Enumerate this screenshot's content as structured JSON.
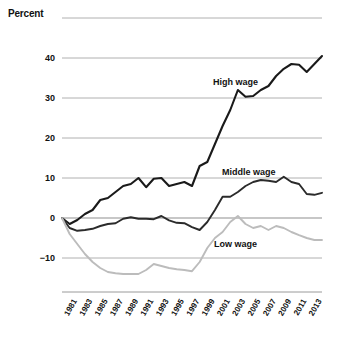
{
  "chart": {
    "title": "Percent",
    "ylabel": "Percent",
    "xlabel": ""
  },
  "series_labels": {
    "high": "High wage",
    "middle": "Middle wage",
    "low": "Low wage"
  },
  "yticks": [
    "40",
    "30",
    "20",
    "10",
    "0",
    "−10"
  ],
  "xticks": [
    "1981",
    "1983",
    "1985",
    "1987",
    "1989",
    "1991",
    "1993",
    "1995",
    "1997",
    "1999",
    "2001",
    "2003",
    "2005",
    "2007",
    "2009",
    "2011",
    "2013"
  ],
  "colors": {
    "high": "#1a1a1a",
    "middle": "#2b2b2b",
    "low": "#bcbcbc",
    "grid": "#b0b0b0",
    "text": "#111111"
  },
  "chart_data": {
    "type": "line",
    "title": "Percent",
    "xlabel": "",
    "ylabel": "Percent",
    "xlim": [
      1979,
      2013
    ],
    "ylim": [
      -15,
      50
    ],
    "yticks": [
      -10,
      0,
      10,
      20,
      30,
      40
    ],
    "xticks": [
      1981,
      1983,
      1985,
      1987,
      1989,
      1991,
      1993,
      1995,
      1997,
      1999,
      2001,
      2003,
      2005,
      2007,
      2009,
      2011,
      2013
    ],
    "grid": true,
    "legend": "inline-annotations",
    "x": [
      1979,
      1980,
      1981,
      1982,
      1983,
      1984,
      1985,
      1986,
      1987,
      1988,
      1989,
      1990,
      1991,
      1992,
      1993,
      1994,
      1995,
      1996,
      1997,
      1998,
      1999,
      2000,
      2001,
      2002,
      2003,
      2004,
      2005,
      2006,
      2007,
      2008,
      2009,
      2010,
      2011,
      2012,
      2013
    ],
    "series": [
      {
        "name": "High wage",
        "color": "#1a1a1a",
        "values": [
          0.0,
          -1.5,
          -0.5,
          1.0,
          2.0,
          4.5,
          5.0,
          6.5,
          8.0,
          8.5,
          10.0,
          7.7,
          9.8,
          10.0,
          8.0,
          8.5,
          9.0,
          8.0,
          13.0,
          14.0,
          18.5,
          23.0,
          27.0,
          32.0,
          30.3,
          30.5,
          32.0,
          33.0,
          35.5,
          37.3,
          38.5,
          38.3,
          36.5,
          38.5,
          40.5
        ]
      },
      {
        "name": "Middle wage",
        "color": "#2b2b2b",
        "values": [
          0.0,
          -2.5,
          -3.2,
          -3.0,
          -2.7,
          -2.0,
          -1.5,
          -1.3,
          -0.2,
          0.2,
          -0.2,
          -0.2,
          -0.3,
          0.5,
          -0.6,
          -1.2,
          -1.3,
          -2.3,
          -3.0,
          -1.0,
          2.0,
          5.3,
          5.3,
          6.5,
          8.0,
          9.0,
          9.5,
          9.3,
          9.0,
          10.3,
          9.0,
          8.5,
          6.0,
          5.8,
          6.3
        ]
      },
      {
        "name": "Low wage",
        "color": "#bcbcbc",
        "values": [
          0.0,
          -4.0,
          -6.5,
          -9.0,
          -11.0,
          -12.5,
          -13.5,
          -13.8,
          -14.0,
          -14.0,
          -14.0,
          -13.0,
          -11.5,
          -12.0,
          -12.5,
          -12.8,
          -13.0,
          -13.3,
          -11.0,
          -7.5,
          -5.0,
          -3.5,
          -1.0,
          0.5,
          -1.5,
          -2.5,
          -2.0,
          -3.0,
          -2.0,
          -2.5,
          -3.5,
          -4.3,
          -5.0,
          -5.5,
          -5.5
        ]
      }
    ]
  }
}
